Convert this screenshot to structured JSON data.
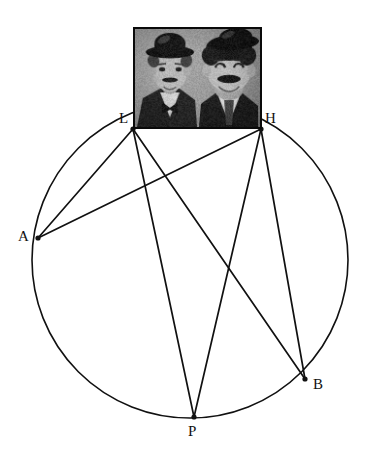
{
  "figure": {
    "background_color": "#ffffff",
    "stroke_color": "#111111",
    "canvas": {
      "width": 370,
      "height": 456
    }
  },
  "chart_data": {
    "type": "scatter",
    "xlabel": "",
    "ylabel": "",
    "xlim": [
      0,
      370
    ],
    "ylim": [
      0,
      456
    ],
    "grid": false,
    "legend": "none",
    "circle": {
      "name": "circumscribed-circle",
      "center_x": 190,
      "center_y": 260,
      "radius": 158,
      "stroke": "#111111",
      "stroke_width": 1.6,
      "fill": "none"
    },
    "points": [
      {
        "label": "L",
        "x": 133,
        "y": 129,
        "label_x": 119,
        "label_y": 111,
        "marker": "dot"
      },
      {
        "label": "H",
        "x": 261,
        "y": 129,
        "label_x": 265,
        "label_y": 111,
        "marker": "dot"
      },
      {
        "label": "A",
        "x": 38,
        "y": 238,
        "label_x": 18,
        "label_y": 229,
        "marker": "dot"
      },
      {
        "label": "B",
        "x": 305,
        "y": 379,
        "label_x": 313,
        "label_y": 377,
        "marker": "dot"
      },
      {
        "label": "P",
        "x": 194,
        "y": 417,
        "label_x": 188,
        "label_y": 424,
        "marker": "dot"
      }
    ],
    "chords": [
      {
        "name": "chord-L-A",
        "from": "L",
        "to": "A"
      },
      {
        "name": "chord-L-P",
        "from": "L",
        "to": "P"
      },
      {
        "name": "chord-L-B",
        "from": "L",
        "to": "B"
      },
      {
        "name": "chord-H-A",
        "from": "H",
        "to": "A"
      },
      {
        "name": "chord-H-P",
        "from": "H",
        "to": "P"
      },
      {
        "name": "chord-H-B",
        "from": "H",
        "to": "B"
      }
    ]
  },
  "photo": {
    "caption": "black-and-white photograph of two men in bowler hats",
    "alt_text": "Laurel and Hardy portrait",
    "x": 133,
    "y": 27,
    "width": 129,
    "height": 102,
    "border_color": "#0a0a0a",
    "background_color": "#cfc9c2"
  },
  "labels": {
    "L": "L",
    "H": "H",
    "A": "A",
    "B": "B",
    "P": "P"
  }
}
